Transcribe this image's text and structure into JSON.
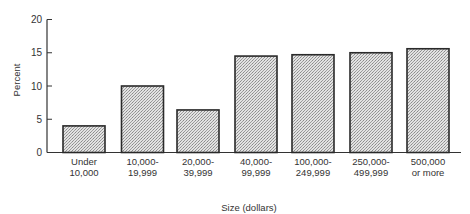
{
  "chart_data": {
    "type": "bar",
    "title": "",
    "xlabel": "Size (dollars)",
    "ylabel": "Percent",
    "ylim": [
      0,
      20
    ],
    "yticks": [
      0,
      5,
      10,
      15,
      20
    ],
    "grid": false,
    "legend": null,
    "categories": [
      "Under 10,000",
      "10,000-19,999",
      "20,000-39,999",
      "40,000-99,999",
      "100,000-249,999",
      "250,000-499,999",
      "500,000 or more"
    ],
    "category_lines": [
      [
        "Under",
        "10,000"
      ],
      [
        "10,000-",
        "19,999"
      ],
      [
        "20,000-",
        "39,999"
      ],
      [
        "40,000-",
        "99,999"
      ],
      [
        "100,000-",
        "249,999"
      ],
      [
        "250,000-",
        "499,999"
      ],
      [
        "500,000",
        "or more"
      ]
    ],
    "values": [
      4.0,
      10.0,
      6.4,
      14.5,
      14.7,
      15.0,
      15.6
    ],
    "bar_fill": "stippled gray",
    "bar_color": "#c8c8c8",
    "edge_color": "#2a2a2a"
  }
}
